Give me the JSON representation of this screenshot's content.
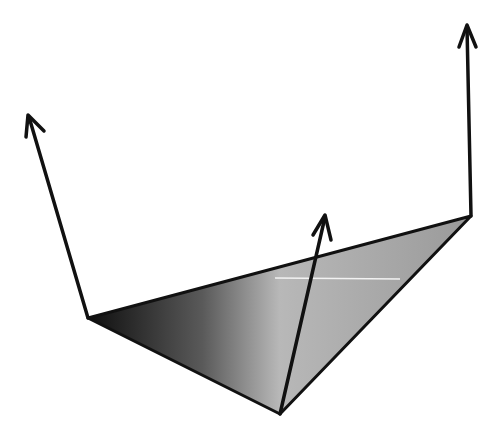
{
  "diagram": {
    "type": "triangle-with-normal-vectors",
    "canvas": {
      "width": 504,
      "height": 441,
      "background": "#ffffff"
    },
    "triangle": {
      "vertices": [
        {
          "name": "left",
          "x": 88,
          "y": 318
        },
        {
          "name": "right",
          "x": 471,
          "y": 216
        },
        {
          "name": "bottom",
          "x": 280,
          "y": 414
        }
      ],
      "fill_gradient": [
        "#0e0e0e",
        "#5a5a5a",
        "#b8b8b8",
        "#9a9a9a"
      ],
      "stroke": "#111111"
    },
    "arrows": [
      {
        "name": "left-vertex-normal",
        "from": [
          88,
          318
        ],
        "to": [
          28,
          115
        ]
      },
      {
        "name": "right-vertex-normal",
        "from": [
          471,
          216
        ],
        "to": [
          467,
          25
        ]
      },
      {
        "name": "face-normal",
        "from": [
          280,
          414
        ],
        "to": [
          325,
          215
        ]
      }
    ],
    "highlight_line": {
      "from": [
        275,
        278
      ],
      "to": [
        400,
        279
      ],
      "color": "#f2f2f2"
    },
    "labels": []
  }
}
